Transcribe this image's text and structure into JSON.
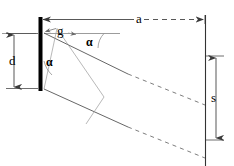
{
  "diagram": {
    "type": "optics-ray-diagram",
    "colors": {
      "ink": "#000000",
      "ray": "#555555",
      "thin": "#777777",
      "grating": "#000000",
      "screen": "#333333",
      "background": "#ffffff"
    },
    "labels": {
      "distance_a": "a",
      "slit_width_d": "d",
      "grating_constant_g": "g",
      "spot_separation_s": "s",
      "angle_upper": "α",
      "angle_lower": "α"
    },
    "elements": {
      "grating_bar": "grating-plate",
      "screen_line": "projection-screen",
      "axis_line": "optical-axis",
      "ray_upper": "diffracted-ray-upper",
      "ray_lower": "diffracted-ray-lower",
      "ray_mid_dashed": "diffracted-ray-middle",
      "dim_a": "dimension-a",
      "dim_d": "dimension-d",
      "dim_s": "dimension-s",
      "dim_g": "dimension-g",
      "arc_upper": "angle-arc-upper",
      "arc_lower": "angle-arc-lower"
    }
  }
}
